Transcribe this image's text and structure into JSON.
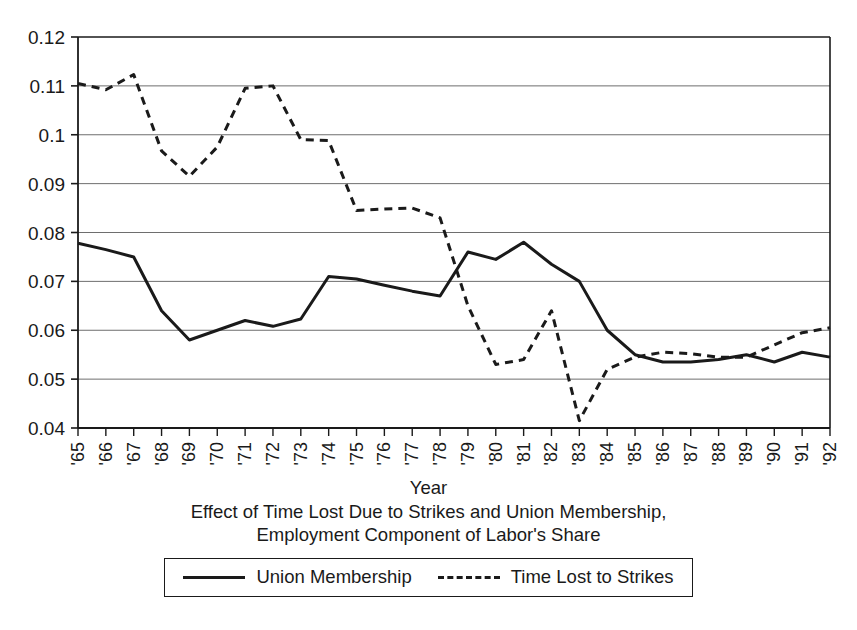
{
  "chart_data": {
    "type": "line",
    "title": "",
    "caption_lines": [
      "Effect of Time Lost Due to Strikes and Union Membership,",
      "Employment Component of Labor's Share"
    ],
    "xlabel": "Year",
    "ylabel": "",
    "ylim": [
      0.04,
      0.12
    ],
    "yticks": [
      0.04,
      0.05,
      0.06,
      0.07,
      0.08,
      0.09,
      0.1,
      0.11,
      0.12
    ],
    "ytick_labels": [
      "0.04",
      "0.05",
      "0.06",
      "0.07",
      "0.08",
      "0.09",
      "0.1",
      "0.11",
      "0.12"
    ],
    "grid": true,
    "grid_axis": "y",
    "legend_position": "bottom",
    "categories": [
      "'65",
      "'66",
      "'67",
      "'68",
      "'69",
      "'70",
      "'71",
      "'72",
      "'73",
      "'74",
      "'75",
      "'76",
      "'77",
      "'78",
      "'79",
      "'80",
      "'81",
      "'82",
      "'83",
      "'84",
      "'85",
      "'86",
      "'87",
      "'88",
      "'89",
      "'90",
      "'91",
      "'92"
    ],
    "series": [
      {
        "name": "Union Membership",
        "style": "solid",
        "color": "#1a1a1a",
        "values": [
          0.0778,
          0.0765,
          0.075,
          0.064,
          0.058,
          0.06,
          0.062,
          0.0608,
          0.0623,
          0.071,
          0.0705,
          0.0692,
          0.068,
          0.067,
          0.076,
          0.0745,
          0.078,
          0.0735,
          0.07,
          0.06,
          0.055,
          0.0535,
          0.0535,
          0.054,
          0.055,
          0.0535,
          0.0555,
          0.0545
        ]
      },
      {
        "name": "Time Lost to Strikes",
        "style": "dashed",
        "color": "#1a1a1a",
        "values": [
          0.1105,
          0.1092,
          0.1123,
          0.0967,
          0.0915,
          0.0975,
          0.1095,
          0.11,
          0.099,
          0.0988,
          0.0845,
          0.0848,
          0.085,
          0.083,
          0.065,
          0.053,
          0.054,
          0.064,
          0.0415,
          0.052,
          0.0545,
          0.0555,
          0.0552,
          0.0545,
          0.0545,
          0.057,
          0.0595,
          0.0605
        ]
      }
    ]
  },
  "legend": {
    "items": [
      {
        "label": "Union Membership",
        "style": "solid"
      },
      {
        "label": "Time Lost to Strikes",
        "style": "dashed"
      }
    ]
  }
}
